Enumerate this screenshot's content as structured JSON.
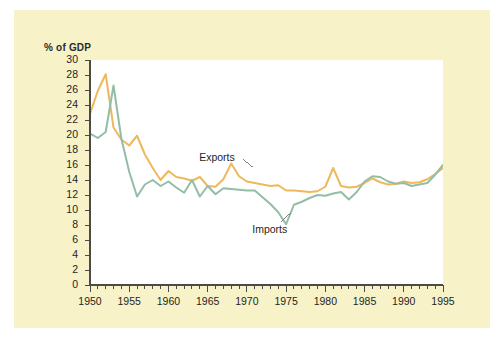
{
  "figure": {
    "axis_title": "% of GDP",
    "card_color": "#f7f2c8",
    "plot_background": "#ffffff",
    "page_background": "#ffffff"
  },
  "labels": {
    "exports": "Exports",
    "imports": "Imports"
  },
  "colors": {
    "exports": "#eeb85c",
    "imports": "#93bda6",
    "axis": "#4a4a4a",
    "text": "#1f1f1f"
  },
  "chart_data": {
    "type": "line",
    "title": "",
    "subtitle": "",
    "xlabel": "",
    "ylabel": "% of GDP",
    "ylim": [
      0,
      30
    ],
    "xlim": [
      1950,
      1995
    ],
    "ytick_step": 2,
    "yticks": [
      0,
      2,
      4,
      6,
      8,
      10,
      12,
      14,
      16,
      18,
      20,
      22,
      24,
      26,
      28,
      30
    ],
    "xticks_major": [
      1950,
      1955,
      1960,
      1965,
      1970,
      1975,
      1980,
      1985,
      1990,
      1995
    ],
    "xtick_minor_step": 1,
    "grid": false,
    "legend": "inline-annotations",
    "x": [
      1950,
      1951,
      1952,
      1953,
      1954,
      1955,
      1956,
      1957,
      1958,
      1959,
      1960,
      1961,
      1962,
      1963,
      1964,
      1965,
      1966,
      1967,
      1968,
      1969,
      1970,
      1971,
      1972,
      1973,
      1974,
      1975,
      1976,
      1977,
      1978,
      1979,
      1980,
      1981,
      1982,
      1983,
      1984,
      1985,
      1986,
      1987,
      1988,
      1989,
      1990,
      1991,
      1992,
      1993,
      1994,
      1995
    ],
    "series": [
      {
        "name": "Exports",
        "color": "#eeb85c",
        "values": [
          22.8,
          25.9,
          28.1,
          21.0,
          19.4,
          18.6,
          19.9,
          17.4,
          15.6,
          14.0,
          15.2,
          14.4,
          14.2,
          13.9,
          14.4,
          13.2,
          13.1,
          14.1,
          16.2,
          14.5,
          13.8,
          13.6,
          13.4,
          13.2,
          13.3,
          12.6,
          12.6,
          12.5,
          12.4,
          12.5,
          13.1,
          15.6,
          13.2,
          13.0,
          13.1,
          13.6,
          14.2,
          13.7,
          13.4,
          13.5,
          13.8,
          13.6,
          13.7,
          14.1,
          14.8,
          15.6
        ]
      },
      {
        "name": "Imports",
        "color": "#93bda6",
        "values": [
          20.2,
          19.6,
          20.4,
          26.6,
          19.5,
          15.1,
          11.8,
          13.4,
          14.0,
          13.2,
          13.8,
          13.0,
          12.3,
          14.0,
          11.8,
          13.2,
          12.1,
          12.9,
          12.8,
          12.7,
          12.6,
          12.6,
          11.7,
          10.8,
          9.7,
          8.1,
          10.7,
          11.1,
          11.6,
          12.0,
          11.9,
          12.2,
          12.4,
          11.4,
          12.4,
          13.8,
          14.5,
          14.4,
          13.8,
          13.5,
          13.6,
          13.2,
          13.4,
          13.6,
          14.7,
          16.0
        ]
      }
    ],
    "annotations": [
      {
        "text": "Exports",
        "at_x": 1968,
        "at_y": 17.0
      },
      {
        "text": "Imports",
        "at_x": 1974,
        "at_y": 7.4
      }
    ]
  }
}
